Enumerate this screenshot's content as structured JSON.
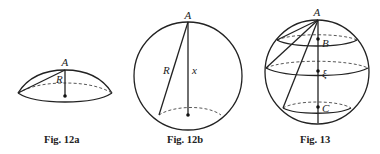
{
  "figures": [
    {
      "id": "fig12a",
      "caption": "Fig. 12a",
      "labels": {
        "apex": "A",
        "chord": "R"
      },
      "shape": "spherical cap"
    },
    {
      "id": "fig12b",
      "caption": "Fig. 12b",
      "labels": {
        "apex": "A",
        "chord": "R",
        "height": "x"
      },
      "shape": "sphere with cap cut"
    },
    {
      "id": "fig13",
      "caption": "Fig. 13",
      "labels": {
        "apex": "A",
        "point_upper": "B",
        "point_middle": "ξ",
        "point_lower": "C"
      },
      "shape": "sphere with three parallel sections"
    }
  ],
  "colors": {
    "line": "#222222",
    "background": "#ffffff"
  }
}
